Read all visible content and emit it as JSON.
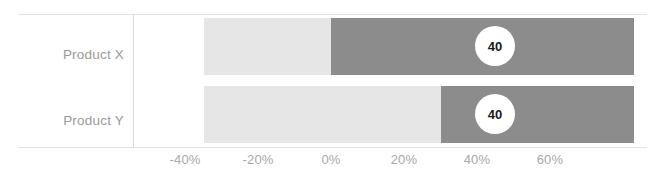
{
  "chart_data": {
    "type": "bar",
    "title": "",
    "subtitle": "",
    "xlabel": "",
    "ylabel": "",
    "orientation": "horizontal",
    "stacked": true,
    "grid": false,
    "legend": null,
    "categories": [
      "Product X",
      "Product Y"
    ],
    "axis": {
      "tick_labels": [
        "-40%",
        "-20%",
        "0%",
        "20%",
        "40%",
        "60%"
      ],
      "tick_values": [
        -40,
        -20,
        0,
        20,
        40,
        60
      ],
      "xlim": [
        -47,
        83
      ],
      "unit": "%"
    },
    "series": [
      {
        "name": "negative-segment",
        "color": "#e6e6e6",
        "values": [
          -35,
          -35
        ]
      },
      {
        "name": "positive-segment",
        "color": "#8c8c8c",
        "values": [
          83,
          83
        ]
      }
    ],
    "bars": [
      {
        "category": "Product X",
        "start_pct": -35,
        "split_pct": 0,
        "end_pct": 83,
        "data_label": "40"
      },
      {
        "category": "Product Y",
        "start_pct": -35,
        "split_pct": 30,
        "end_pct": 83,
        "data_label": "40"
      }
    ],
    "data_labels": [
      "40",
      "40"
    ]
  },
  "colors": {
    "light_segment": "#e6e6e6",
    "dark_segment": "#8c8c8c",
    "label_text": "#9a9a9a",
    "tick_text": "#a8a8a8",
    "rule": "#e3e3e3",
    "bubble_fill": "#ffffff",
    "bubble_text": "#1a1a1a",
    "background": "#ffffff"
  },
  "geometry": {
    "ticks_px": [
      {
        "label": "-40%",
        "x": 185
      },
      {
        "label": "-20%",
        "x": 258
      },
      {
        "label": "0%",
        "x": 331
      },
      {
        "label": "20%",
        "x": 404
      },
      {
        "label": "40%",
        "x": 477
      },
      {
        "label": "60%",
        "x": 550
      }
    ],
    "rows_px": [
      {
        "left": 204,
        "split": 331,
        "right": 634,
        "bubble_cx": 495
      },
      {
        "left": 204,
        "split": 441,
        "right": 634,
        "bubble_cx": 495
      }
    ]
  }
}
